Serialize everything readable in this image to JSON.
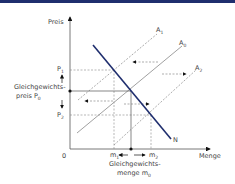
{
  "header": {
    "bar_color": "#1f2e6e"
  },
  "diagram": {
    "y_axis_label": "Preis",
    "x_axis_label": "Menge",
    "origin_label": "0",
    "curves": {
      "demand": {
        "label": "N",
        "color": "#1f2e6e"
      },
      "supply_0": {
        "label": "A",
        "sub": "0"
      },
      "supply_1": {
        "label": "A",
        "sub": "1"
      },
      "supply_2": {
        "label": "A",
        "sub": "2"
      }
    },
    "price_levels": {
      "p1": {
        "label": "P",
        "sub": "1"
      },
      "p2": {
        "label": "P",
        "sub": "2"
      },
      "p0_line1": "Gleichgewichts-",
      "p0_line2": "preis P",
      "p0_sub": "0"
    },
    "quantity_levels": {
      "m1": {
        "label": "m",
        "sub": "1"
      },
      "m2": {
        "label": "m",
        "sub": "2"
      },
      "m0_line1": "Gleichgewichts-",
      "m0_line2": "menge m",
      "m0_sub": "0"
    }
  }
}
